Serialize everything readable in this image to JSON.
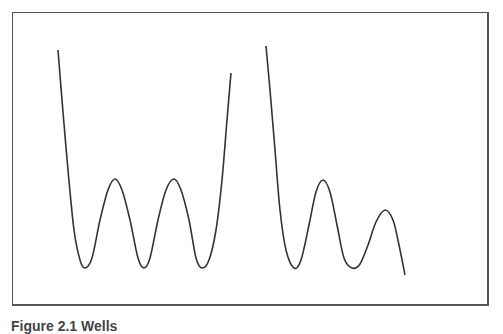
{
  "figure": {
    "caption": "Figure 2.1  Wells",
    "stroke_color": "#333333",
    "border_color": "#555555"
  },
  "curves": [
    {
      "name": "left-curve",
      "points": [
        [
          58,
          50
        ],
        [
          62,
          100
        ],
        [
          68,
          170
        ],
        [
          74,
          230
        ],
        [
          80,
          260
        ],
        [
          85,
          268
        ],
        [
          92,
          258
        ],
        [
          100,
          220
        ],
        [
          108,
          190
        ],
        [
          115,
          179
        ],
        [
          122,
          190
        ],
        [
          130,
          220
        ],
        [
          138,
          258
        ],
        [
          144,
          268
        ],
        [
          150,
          258
        ],
        [
          158,
          220
        ],
        [
          166,
          190
        ],
        [
          174,
          179
        ],
        [
          181,
          190
        ],
        [
          189,
          220
        ],
        [
          196,
          258
        ],
        [
          202,
          268
        ],
        [
          209,
          260
        ],
        [
          216,
          230
        ],
        [
          222,
          180
        ],
        [
          227,
          120
        ],
        [
          231,
          73
        ]
      ]
    },
    {
      "name": "right-curve",
      "points": [
        [
          266,
          46
        ],
        [
          270,
          90
        ],
        [
          275,
          150
        ],
        [
          280,
          210
        ],
        [
          286,
          250
        ],
        [
          294,
          268
        ],
        [
          301,
          260
        ],
        [
          309,
          225
        ],
        [
          316,
          192
        ],
        [
          323,
          180
        ],
        [
          330,
          192
        ],
        [
          337,
          225
        ],
        [
          344,
          258
        ],
        [
          352,
          268
        ],
        [
          360,
          264
        ],
        [
          368,
          245
        ],
        [
          376,
          222
        ],
        [
          385,
          210
        ],
        [
          393,
          220
        ],
        [
          399,
          245
        ],
        [
          405,
          275
        ]
      ]
    }
  ]
}
